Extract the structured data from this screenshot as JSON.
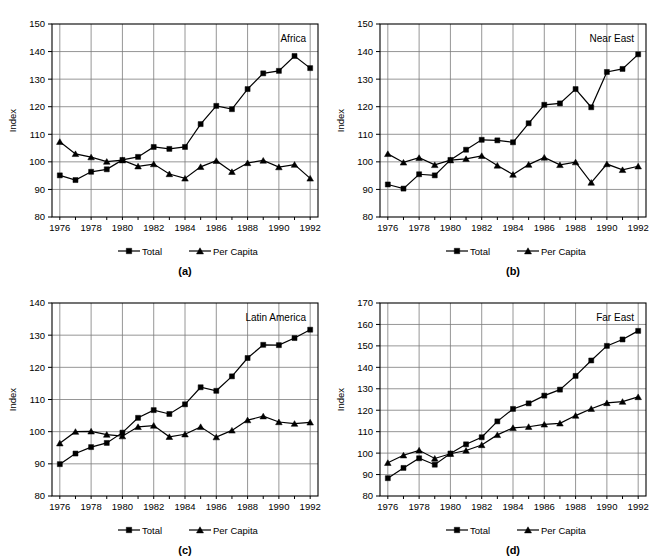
{
  "figure": {
    "background": "#ffffff",
    "ink_color": "#000000",
    "grid_color": "#7b7b7b"
  },
  "legend": {
    "total_label": "Total",
    "per_capita_label": "Per Capita",
    "total_marker": "square-marker",
    "per_capita_marker": "triangle-marker"
  },
  "axis": {
    "ylabel": "Index"
  },
  "panels": [
    {
      "caption": "(a)",
      "title": "Africa"
    },
    {
      "caption": "(b)",
      "title": "Near East"
    },
    {
      "caption": "(c)",
      "title": "Latin America"
    },
    {
      "caption": "(d)",
      "title": "Far East"
    }
  ],
  "chart_data": [
    {
      "type": "line",
      "title": "Africa",
      "panel": "(a)",
      "xlabel": "",
      "ylabel": "Index",
      "x": [
        1976,
        1977,
        1978,
        1979,
        1980,
        1981,
        1982,
        1983,
        1984,
        1985,
        1986,
        1987,
        1988,
        1989,
        1990,
        1991,
        1992
      ],
      "xticks": [
        1976,
        1978,
        1980,
        1982,
        1984,
        1986,
        1988,
        1990,
        1992
      ],
      "yticks": [
        80,
        90,
        100,
        110,
        120,
        130,
        140,
        150
      ],
      "xlim": [
        1975.5,
        1992.5
      ],
      "ylim": [
        80,
        150
      ],
      "grid": true,
      "legend_position": "below",
      "series": [
        {
          "name": "Total",
          "marker": "square",
          "values": [
            95.1,
            93.4,
            96.4,
            97.3,
            100.7,
            101.8,
            105.4,
            104.7,
            105.4,
            113.7,
            120.3,
            119.1,
            126.4,
            132.1,
            133.0,
            138.4,
            134.0
          ]
        },
        {
          "name": "Per Capita",
          "marker": "triangle",
          "values": [
            107.3,
            102.9,
            101.7,
            100.1,
            100.6,
            98.4,
            99.2,
            95.6,
            94.0,
            98.2,
            100.4,
            96.4,
            99.6,
            100.5,
            98.1,
            99.0,
            94.0
          ]
        }
      ]
    },
    {
      "type": "line",
      "title": "Near East",
      "panel": "(b)",
      "xlabel": "",
      "ylabel": "Index",
      "x": [
        1976,
        1977,
        1978,
        1979,
        1980,
        1981,
        1982,
        1983,
        1984,
        1985,
        1986,
        1987,
        1988,
        1989,
        1990,
        1991,
        1992
      ],
      "xticks": [
        1976,
        1978,
        1980,
        1982,
        1984,
        1986,
        1988,
        1990,
        1992
      ],
      "yticks": [
        80,
        90,
        100,
        110,
        120,
        130,
        140,
        150
      ],
      "xlim": [
        1975.5,
        1992.5
      ],
      "ylim": [
        80,
        150
      ],
      "grid": true,
      "legend_position": "below",
      "series": [
        {
          "name": "Total",
          "marker": "square",
          "values": [
            91.8,
            90.3,
            95.5,
            95.1,
            100.7,
            104.4,
            108.0,
            107.8,
            107.1,
            114.0,
            120.7,
            121.2,
            126.4,
            119.8,
            132.6,
            133.7,
            139.0
          ]
        },
        {
          "name": "Per Capita",
          "marker": "triangle",
          "values": [
            102.9,
            99.8,
            101.5,
            98.9,
            100.6,
            101.1,
            102.2,
            98.7,
            95.4,
            99.0,
            101.6,
            98.9,
            99.9,
            92.5,
            99.2,
            97.1,
            98.4
          ]
        }
      ]
    },
    {
      "type": "line",
      "title": "Latin America",
      "panel": "(c)",
      "xlabel": "",
      "ylabel": "Index",
      "x": [
        1976,
        1977,
        1978,
        1979,
        1980,
        1981,
        1982,
        1983,
        1984,
        1985,
        1986,
        1987,
        1988,
        1989,
        1990,
        1991,
        1992
      ],
      "xticks": [
        1976,
        1978,
        1980,
        1982,
        1984,
        1986,
        1988,
        1990,
        1992
      ],
      "yticks": [
        80,
        90,
        100,
        110,
        120,
        130,
        140
      ],
      "xlim": [
        1975.5,
        1992.5
      ],
      "ylim": [
        80,
        140
      ],
      "grid": true,
      "legend_position": "below",
      "series": [
        {
          "name": "Total",
          "marker": "square",
          "values": [
            89.9,
            93.2,
            95.2,
            96.5,
            99.7,
            104.3,
            106.7,
            105.5,
            108.5,
            113.8,
            112.7,
            117.2,
            122.9,
            127.0,
            126.9,
            129.1,
            131.7
          ]
        },
        {
          "name": "Per Capita",
          "marker": "triangle",
          "values": [
            96.4,
            100.0,
            100.1,
            99.1,
            98.6,
            101.5,
            101.9,
            98.4,
            99.2,
            101.5,
            98.3,
            100.4,
            103.6,
            104.8,
            103.0,
            102.5,
            102.9
          ]
        }
      ]
    },
    {
      "type": "line",
      "title": "Far East",
      "panel": "(d)",
      "xlabel": "",
      "ylabel": "Index",
      "x": [
        1976,
        1977,
        1978,
        1979,
        1980,
        1981,
        1982,
        1983,
        1984,
        1985,
        1986,
        1987,
        1988,
        1989,
        1990,
        1991,
        1992
      ],
      "xticks": [
        1976,
        1978,
        1980,
        1982,
        1984,
        1986,
        1988,
        1990,
        1992
      ],
      "yticks": [
        80,
        90,
        100,
        110,
        120,
        130,
        140,
        150,
        160,
        170
      ],
      "xlim": [
        1975.5,
        1992.5
      ],
      "ylim": [
        80,
        170
      ],
      "grid": true,
      "legend_position": "below",
      "series": [
        {
          "name": "Total",
          "marker": "square",
          "values": [
            88.3,
            93.1,
            97.6,
            94.6,
            99.8,
            104.1,
            107.4,
            114.8,
            120.6,
            123.2,
            126.8,
            129.6,
            136.0,
            143.2,
            150.0,
            153.0,
            157.0
          ]
        },
        {
          "name": "Per Capita",
          "marker": "triangle",
          "values": [
            95.5,
            99.0,
            101.3,
            97.5,
            99.7,
            101.2,
            103.8,
            108.5,
            111.8,
            112.3,
            113.4,
            113.9,
            117.5,
            120.7,
            123.4,
            124.0,
            126.2
          ]
        }
      ]
    }
  ]
}
